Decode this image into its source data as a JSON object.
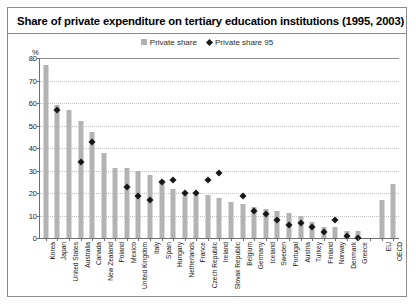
{
  "header": {
    "title": "Share of private expenditure on tertiary education institutions (1995, 2003)"
  },
  "legend": {
    "items": [
      {
        "label": "Private share",
        "marker": "square-icon",
        "color": "#b3b3b3"
      },
      {
        "label": "Private share 95",
        "marker": "diamond-icon",
        "color": "#171717"
      }
    ]
  },
  "chart_data": {
    "type": "bar",
    "title": "Share of private expenditure on tertiary education institutions (1995, 2003)",
    "xlabel": "",
    "ylabel": "%",
    "ylim": [
      0,
      80
    ],
    "yticks": [
      0,
      10,
      20,
      30,
      40,
      50,
      60,
      70,
      80
    ],
    "grid": true,
    "legend_position": "top-center",
    "categories": [
      "Korea",
      "Japan",
      "United States",
      "Australia",
      "Canada",
      "New Zealand",
      "Poland",
      "Mexico",
      "United Kingdom",
      "Italy",
      "Spain",
      "Hungary",
      "Netherlands",
      "France",
      "Czech Republic",
      "Ireland",
      "Slovak Republic",
      "Belgium",
      "Germany",
      "Iceland",
      "Sweden",
      "Portugal",
      "Austria",
      "Turkey",
      "Finland",
      "Norway",
      "Denmark",
      "Greece",
      "",
      "EU",
      "OECD"
    ],
    "series": [
      {
        "name": "Private share",
        "values": [
          77,
          59,
          57,
          52,
          47,
          38,
          31,
          31,
          30,
          28,
          26,
          22,
          20,
          20,
          19,
          18,
          16,
          15,
          14,
          13,
          12,
          11,
          10,
          7,
          5,
          5,
          3,
          3,
          null,
          17,
          24
        ]
      },
      {
        "name": "Private share 95",
        "values": [
          null,
          58,
          null,
          35,
          44,
          null,
          null,
          24,
          20,
          18,
          26,
          27,
          21,
          21,
          27,
          30,
          null,
          20,
          13,
          12,
          9,
          7,
          8,
          6,
          4,
          9,
          2,
          1,
          null,
          null,
          null
        ]
      }
    ]
  }
}
